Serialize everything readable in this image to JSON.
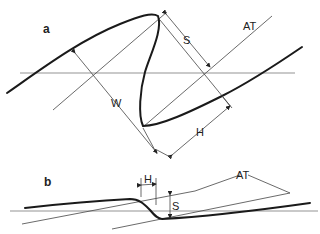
{
  "figure": {
    "panel_a": {
      "label": "a",
      "annotations": {
        "S": "S",
        "AT": "AT",
        "W": "W",
        "H": "H"
      }
    },
    "panel_b": {
      "label": "b",
      "annotations": {
        "H": "H",
        "S": "S",
        "AT": "AT"
      }
    }
  },
  "colors": {
    "line": "#1a1a1a",
    "thin_line": "#444444",
    "background": "#ffffff"
  }
}
